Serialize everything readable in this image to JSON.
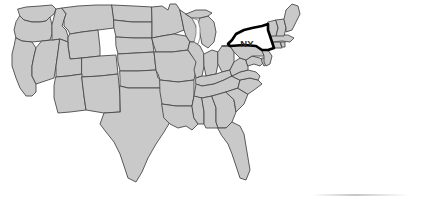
{
  "figure": {
    "type": "map",
    "region": "Contiguous United States",
    "width": 439,
    "height": 201,
    "background_color": "#ffffff"
  },
  "map": {
    "state_fill_color": "#c9c9c9",
    "state_border_color": "#4a4a4a",
    "highlight_fill_color": "#ffffff",
    "highlight_outline_color": "#000000",
    "lake_fill_color": "#ffffff",
    "label_color": "#2b2b2b",
    "highlighted_state": {
      "abbreviation": "NY",
      "label": "NY"
    },
    "labels": [
      {
        "text": "NY",
        "x": 247,
        "y": 47
      }
    ]
  },
  "artifact": {
    "name": "scan-smudge"
  }
}
